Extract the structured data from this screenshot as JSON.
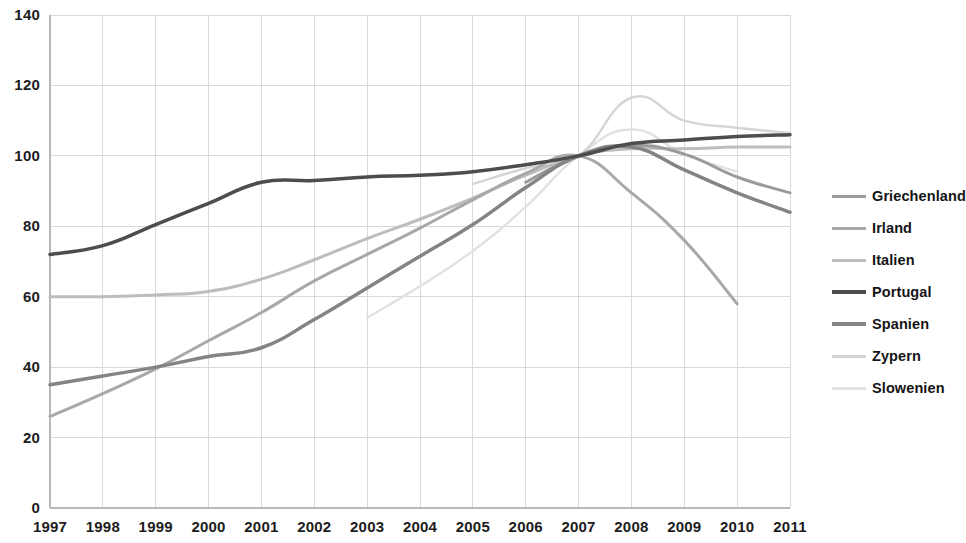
{
  "chart_data": {
    "type": "line",
    "title": "",
    "subtitle": "",
    "xlabel": "",
    "ylabel": "",
    "x": [
      1997,
      1998,
      1999,
      2000,
      2001,
      2002,
      2003,
      2004,
      2005,
      2006,
      2007,
      2008,
      2009,
      2010,
      2011
    ],
    "xtick_labels": [
      "1997",
      "1998",
      "1999",
      "2000",
      "2001",
      "2002",
      "2003",
      "2004",
      "2005",
      "2006",
      "2007",
      "2008",
      "2009",
      "2010",
      "2011"
    ],
    "ytick_labels": [
      "0",
      "20",
      "40",
      "60",
      "80",
      "100",
      "120",
      "140"
    ],
    "ytick_values": [
      0,
      20,
      40,
      60,
      80,
      100,
      120,
      140
    ],
    "ylim": [
      0,
      140
    ],
    "xlim": [
      1997,
      2011
    ],
    "grid": true,
    "grid_color": "#d9d9d9",
    "legend_position": "right",
    "index_base": "2007 = 100",
    "series": [
      {
        "name": "Griechenland",
        "color": "#9a9a9a",
        "width": 3.0,
        "values": [
          null,
          null,
          null,
          null,
          null,
          null,
          null,
          null,
          null,
          92.5,
          100,
          103.0,
          100.5,
          94.0,
          89.5
        ]
      },
      {
        "name": "Irland",
        "color": "#a8a8a8",
        "width": 3.0,
        "values": [
          26.0,
          32.5,
          39.5,
          47.5,
          55.5,
          64.5,
          72.0,
          79.5,
          87.5,
          95.0,
          100,
          89.5,
          76.0,
          58.0,
          null
        ]
      },
      {
        "name": "Italien",
        "color": "#bdbdbd",
        "width": 3.0,
        "values": [
          60.0,
          60.0,
          60.5,
          61.5,
          65.0,
          70.5,
          76.5,
          82.0,
          88.0,
          94.5,
          100,
          102.0,
          102.0,
          102.5,
          102.5
        ]
      },
      {
        "name": "Portugal",
        "color": "#4d4d4d",
        "width": 3.5,
        "values": [
          72.0,
          74.5,
          80.5,
          86.5,
          92.5,
          93.0,
          94.0,
          94.5,
          95.5,
          97.5,
          100,
          103.5,
          104.5,
          105.5,
          106.0
        ]
      },
      {
        "name": "Spanien",
        "color": "#848484",
        "width": 3.5,
        "values": [
          35.0,
          37.5,
          40.0,
          43.0,
          45.5,
          53.5,
          62.5,
          71.5,
          80.5,
          91.0,
          100,
          102.5,
          96.0,
          89.5,
          84.0
        ]
      },
      {
        "name": "Zypern",
        "color": "#d5d5d5",
        "width": 2.5,
        "values": [
          null,
          null,
          null,
          null,
          null,
          null,
          null,
          null,
          92.0,
          96.5,
          100,
          116.5,
          110.0,
          108.0,
          106.5
        ]
      },
      {
        "name": "Slowenien",
        "color": "#e2e2e2",
        "width": 2.5,
        "values": [
          null,
          null,
          null,
          null,
          null,
          null,
          54.0,
          63.0,
          73.0,
          85.5,
          100,
          107.5,
          100.5,
          95.5,
          null
        ]
      }
    ]
  },
  "legend": {
    "items": [
      {
        "label": "Griechenland"
      },
      {
        "label": "Irland"
      },
      {
        "label": "Italien"
      },
      {
        "label": "Portugal"
      },
      {
        "label": "Spanien"
      },
      {
        "label": "Zypern"
      },
      {
        "label": "Slowenien"
      }
    ]
  }
}
